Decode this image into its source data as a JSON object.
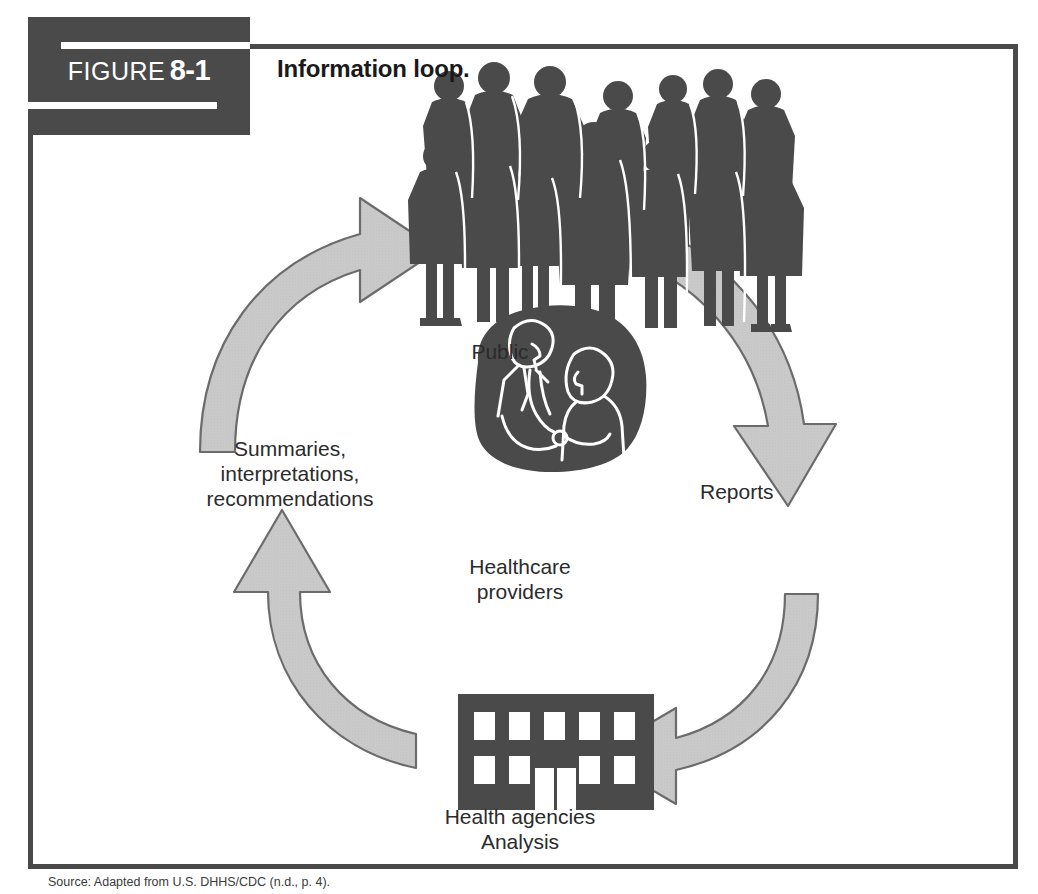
{
  "figure": {
    "badge_word": "FIGURE",
    "badge_number": "8-1",
    "title": "Information loop.",
    "caption": "Source: Adapted from U.S. DHHS/CDC (n.d., p. 4)."
  },
  "diagram": {
    "type": "cycle",
    "nodes": [
      {
        "id": "public",
        "label": "Public",
        "icon": "crowd-silhouette-icon",
        "position": "top"
      },
      {
        "id": "providers",
        "label": "Healthcare\nproviders",
        "icon": "doctor-patient-icon",
        "position": "center"
      },
      {
        "id": "agencies",
        "label": "Health agencies\nAnalysis",
        "icon": "office-building-icon",
        "position": "bottom"
      }
    ],
    "node_labels": {
      "public": "Public",
      "providers_line1": "Healthcare",
      "providers_line2": "providers",
      "agencies_line1": "Health agencies",
      "agencies_line2": "Analysis"
    },
    "edge_labels": {
      "reports": "Reports",
      "summaries_line1": "Summaries,",
      "summaries_line2": "interpretations,",
      "summaries_line3": "recommendations"
    },
    "arrows": [
      {
        "id": "public-to-reports",
        "from": "public",
        "to": "agencies",
        "label": "Reports",
        "direction": "clockwise-right"
      },
      {
        "id": "reports-to-agencies",
        "from": "reports",
        "to": "agencies",
        "label": "",
        "direction": "clockwise-bottom-right"
      },
      {
        "id": "agencies-to-summary",
        "from": "agencies",
        "to": "public",
        "label": "Summaries, interpretations, recommendations",
        "direction": "counter-bottom-left"
      },
      {
        "id": "summary-to-public",
        "from": "summary",
        "to": "public",
        "label": "",
        "direction": "counter-top-left"
      }
    ]
  },
  "colors": {
    "frame": "#4a4a4a",
    "badge_background": "#4a4a4a",
    "badge_text": "#ffffff",
    "arrow_fill": "#c9c9c9",
    "arrow_stroke": "#6b6b6b",
    "silhouette": "#4a4a4a",
    "building": "#4a4a4a",
    "label_text": "#2b2b2b"
  }
}
